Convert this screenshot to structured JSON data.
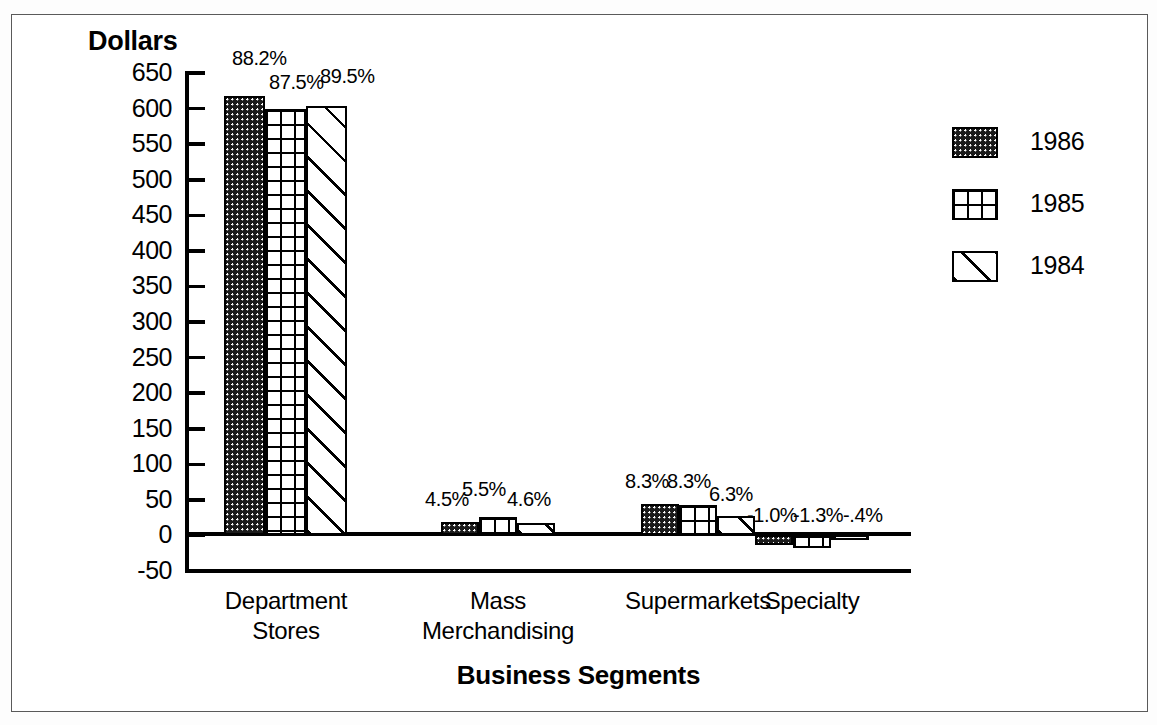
{
  "chart_data": {
    "type": "bar",
    "title": "",
    "ylabel": "Dollars",
    "xlabel": "Business Segments",
    "categories": [
      "Department Stores",
      "Mass Merchandising",
      "Supermarkets",
      "Specialty"
    ],
    "category_lines": [
      [
        "Department",
        "Stores"
      ],
      [
        "Mass",
        "Merchandising"
      ],
      [
        "Supermarkets",
        ""
      ],
      [
        "Specialty",
        ""
      ]
    ],
    "ylim": [
      -50,
      650
    ],
    "ytick_step": 50,
    "yticks": [
      "650",
      "600",
      "550",
      "500",
      "450",
      "400",
      "350",
      "300",
      "250",
      "200",
      "150",
      "100",
      "50",
      "0",
      "-50"
    ],
    "grid": false,
    "legend_position": "right",
    "series": [
      {
        "name": "1986",
        "pattern": "dots",
        "values": [
          617,
          19,
          44,
          -14
        ],
        "labels": [
          "88.2%",
          "4.5%",
          "8.3%",
          "-1.0%"
        ]
      },
      {
        "name": "1985",
        "pattern": "grid",
        "values": [
          600,
          26,
          43,
          -18
        ],
        "labels": [
          "87.5%",
          "5.5%",
          "8.3%",
          "-1.3%"
        ]
      },
      {
        "name": "1984",
        "pattern": "diagonal",
        "values": [
          603,
          18,
          27,
          -5
        ],
        "labels": [
          "89.5%",
          "4.6%",
          "6.3%",
          "-.4%"
        ]
      }
    ]
  },
  "legend": {
    "items": [
      {
        "label": "1986",
        "pattern": "dots"
      },
      {
        "label": "1985",
        "pattern": "grid"
      },
      {
        "label": "1984",
        "pattern": "diagonal"
      }
    ]
  },
  "colors": {
    "foreground": "#000000",
    "background": "#ffffff",
    "frame": "#5a5a5a"
  }
}
